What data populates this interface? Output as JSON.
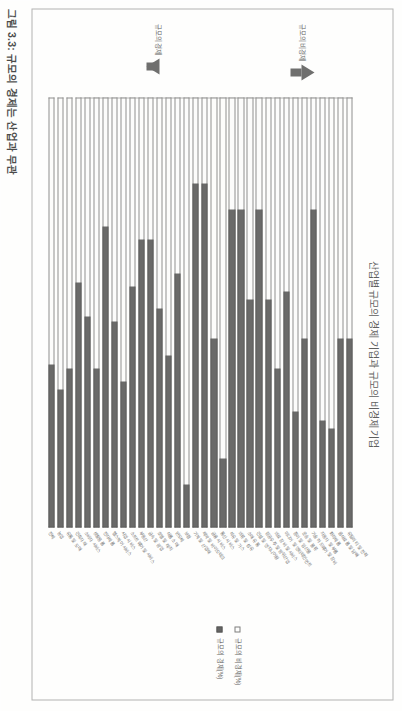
{
  "figure": {
    "caption": "그림 3.3: 규모의 경제는 산업과 무관",
    "chart_title": "산업별 규모의 경제 기업과 규모의 비경제 기업"
  },
  "legend": {
    "items": [
      {
        "label": "규모의 비경제(%)",
        "swatch": "hollow-square-icon",
        "color": "#ffffff"
      },
      {
        "label": "규모의 경제(%)",
        "swatch": "filled-square-icon",
        "color": "#333333"
      }
    ]
  },
  "annotations": {
    "arrow_up_label": "규모의 비경제",
    "arrow_down_label": "규모의 경제"
  },
  "chart_data": {
    "type": "bar",
    "orientation": "horizontal",
    "stacked": true,
    "title": "산업별 규모의 경제 기업과 규모의 비경제 기업",
    "xlabel": "",
    "ylabel": "",
    "xlim": [
      0,
      100
    ],
    "grid": false,
    "legend_position": "right",
    "categories": [
      "유틸리티 및 전력",
      "음식료품 및 담배",
      "화학제품",
      "자동차 및 부품",
      "기술 하드웨어 및 장비",
      "운송 및 물류",
      "종이 및 임산물",
      "미디어 및 엔터테인먼트",
      "의료 장비 및 서비스",
      "항공우주 및 방위산업",
      "건설 및 엔지니어링",
      "소매 유통",
      "의류 및 섬유",
      "석유 및 가스",
      "통신 서비스",
      "금융 서비스",
      "제약 및 바이오테크",
      "기계 및 산업재",
      "보험",
      "반도체",
      "식품 소매",
      "호텔 및 레저",
      "금속 및 광업",
      "부동산",
      "소프트웨어 및 서비스",
      "사업 서비스",
      "헬스케어 서비스",
      "전자제품",
      "생활용품",
      "소비자 서비스",
      "건축자재",
      "유통 및 도매",
      "농업",
      "전체"
    ],
    "series": [
      {
        "name": "규모의 비경제(%)",
        "color": "#ffffff",
        "values": [
          56,
          56,
          77,
          75,
          26,
          56,
          73,
          45,
          63,
          47,
          26,
          47,
          26,
          26,
          84,
          56,
          20,
          20,
          90,
          41,
          60,
          49,
          33,
          33,
          44,
          66,
          52,
          30,
          63,
          51,
          43,
          63,
          68,
          62
        ]
      },
      {
        "name": "규모의 경제(%)",
        "color": "#333333",
        "values": [
          44,
          44,
          23,
          25,
          74,
          44,
          27,
          55,
          37,
          53,
          74,
          53,
          74,
          74,
          16,
          44,
          80,
          80,
          10,
          59,
          40,
          51,
          67,
          67,
          56,
          34,
          48,
          70,
          37,
          49,
          57,
          37,
          32,
          38
        ]
      }
    ]
  }
}
